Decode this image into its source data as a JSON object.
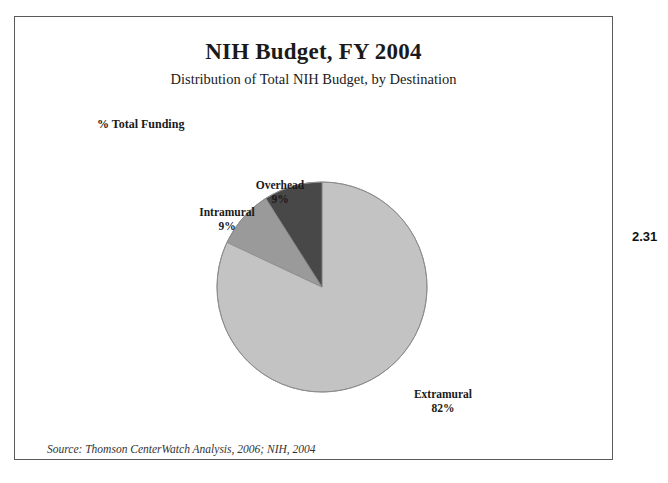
{
  "figure": {
    "number": "2.31"
  },
  "chart_data": {
    "type": "pie",
    "title": "NIH Budget, FY 2004",
    "subtitle": "Distribution of Total NIH Budget, by Destination",
    "axis_note": "% Total Funding",
    "source": "Source: Thomson CenterWatch Analysis, 2006; NIH, 2004",
    "unit": "%",
    "legend_position": "none",
    "start_angle_deg": 0,
    "direction": "clockwise",
    "categories": [
      "Extramural",
      "Overhead",
      "Intramural"
    ],
    "values": [
      82,
      9,
      9
    ],
    "colors": [
      "#c3c3c3",
      "#9a9a9a",
      "#484848"
    ],
    "slices": [
      {
        "name": "Extramural",
        "label": "Extramural",
        "value": 82,
        "value_label": "82%",
        "color": "#c3c3c3"
      },
      {
        "name": "Overhead",
        "label": "Overhead",
        "value": 9,
        "value_label": "9%",
        "color": "#9a9a9a"
      },
      {
        "name": "Intramural",
        "label": "Intramural",
        "value": 9,
        "value_label": "9%",
        "color": "#484848"
      }
    ]
  }
}
